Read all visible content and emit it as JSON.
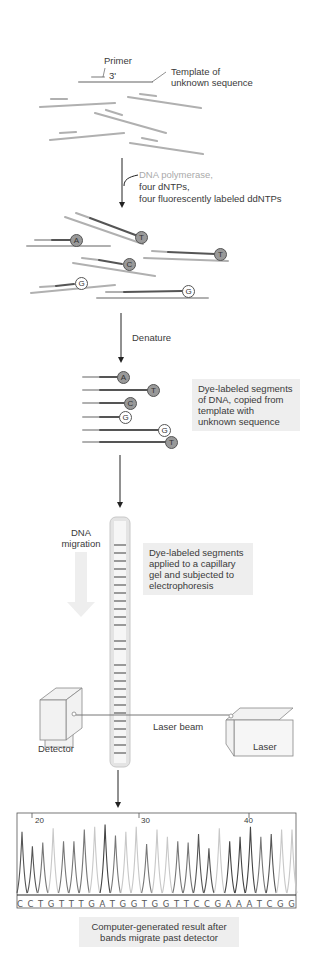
{
  "step1": {
    "primer_label": "Primer",
    "primer_end": "3'",
    "template_label_1": "Template of",
    "template_label_2": "unknown sequence"
  },
  "reagents": {
    "line1": "DNA polymerase,",
    "line2": "four dNTPs,",
    "line3": "four fluorescently labeled ddNTPs"
  },
  "extension_labels": [
    "A",
    "T",
    "C",
    "T",
    "G",
    "G"
  ],
  "denature_label": "Denature",
  "segments": {
    "labels": [
      "A",
      "T",
      "C",
      "G",
      "G",
      "T"
    ],
    "caption": [
      "Dye-labeled segments",
      "of DNA, copied from",
      "template with",
      "unknown sequence"
    ]
  },
  "electrophoresis": {
    "migration_label_1": "DNA",
    "migration_label_2": "migration",
    "caption": [
      "Dye-labeled segments",
      "applied to a capillary",
      "gel and subjected to",
      "electrophoresis"
    ],
    "detector_label": "Detector",
    "laser_label": "Laser",
    "beam_label": "Laser beam"
  },
  "chart_data": {
    "type": "line",
    "title": "",
    "xlabel": "Base position",
    "ylabel": "Fluorescence",
    "tick_labels": [
      "20",
      "30",
      "40"
    ],
    "sequence": [
      "C",
      "C",
      "T",
      "G",
      "T",
      "T",
      "T",
      "G",
      "A",
      "T",
      "G",
      "G",
      "T",
      "G",
      "G",
      "T",
      "T",
      "C",
      "C",
      "G",
      "A",
      "A",
      "A",
      "T",
      "C",
      "G",
      "G"
    ],
    "peak_heights_relative": [
      0.85,
      0.65,
      0.7,
      0.9,
      0.72,
      0.72,
      0.88,
      0.92,
      0.95,
      0.8,
      0.85,
      0.92,
      0.68,
      0.88,
      0.78,
      0.72,
      0.7,
      0.82,
      0.62,
      0.9,
      0.72,
      0.78,
      0.92,
      0.78,
      0.82,
      0.88,
      0.88
    ],
    "grid": false
  },
  "result_caption": [
    "Computer-generated result after",
    "bands migrate past detector"
  ]
}
